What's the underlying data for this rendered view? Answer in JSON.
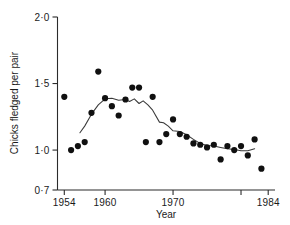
{
  "chart_data": {
    "type": "scatter",
    "title": "",
    "xlabel": "Year",
    "ylabel": "Chicks fledged per pair",
    "xlim": [
      1953,
      1985
    ],
    "ylim": [
      0.7,
      2.0
    ],
    "grid": false,
    "legend": "none",
    "x_ticks": [
      1954,
      1960,
      1970,
      1980,
      1984
    ],
    "x_tick_labels": [
      "1954",
      "1960",
      "1970",
      "",
      "1984"
    ],
    "y_ticks": [
      0.7,
      1.0,
      1.5,
      2.0
    ],
    "y_tick_labels": [
      "0·7",
      "1·0",
      "1·5",
      "2·0"
    ],
    "series": [
      {
        "name": "Chicks fledged per pair",
        "marker": "filled-circle",
        "color": "#101010",
        "x": [
          1954,
          1955,
          1956,
          1957,
          1958,
          1959,
          1960,
          1961,
          1962,
          1963,
          1964,
          1965,
          1966,
          1967,
          1968,
          1969,
          1970,
          1971,
          1972,
          1973,
          1974,
          1975,
          1976,
          1977,
          1978,
          1979,
          1980,
          1981,
          1982,
          1983
        ],
        "y": [
          1.4,
          1.0,
          1.03,
          1.06,
          1.28,
          1.59,
          1.39,
          1.33,
          1.26,
          1.38,
          1.47,
          1.47,
          1.06,
          1.4,
          1.06,
          1.12,
          1.23,
          1.12,
          1.1,
          1.05,
          1.04,
          1.02,
          1.04,
          0.93,
          1.03,
          1.0,
          1.03,
          0.96,
          1.08,
          0.86
        ]
      },
      {
        "name": "smoothed trend",
        "marker": "none",
        "line": true,
        "color": "#3a3a3a",
        "x": [
          1956.3,
          1957.0,
          1958.0,
          1959.0,
          1960.0,
          1961.0,
          1962.0,
          1963.0,
          1963.6,
          1964.3,
          1965.0,
          1965.6,
          1966.3,
          1967.0,
          1968.0,
          1968.6,
          1969.3,
          1970.0,
          1971.0,
          1972.0,
          1973.0,
          1974.0,
          1975.0,
          1976.0,
          1977.0,
          1978.0,
          1979.0,
          1980.0,
          1981.0,
          1982.0
        ],
        "y": [
          1.13,
          1.18,
          1.27,
          1.34,
          1.385,
          1.39,
          1.375,
          1.38,
          1.365,
          1.385,
          1.35,
          1.37,
          1.34,
          1.3,
          1.21,
          1.205,
          1.18,
          1.145,
          1.14,
          1.115,
          1.08,
          1.05,
          1.035,
          1.03,
          1.02,
          1.01,
          1.005,
          0.995,
          0.995,
          1.01
        ]
      }
    ]
  },
  "axis": {
    "y_label": "Chicks fledged per pair",
    "x_label": "Year"
  }
}
